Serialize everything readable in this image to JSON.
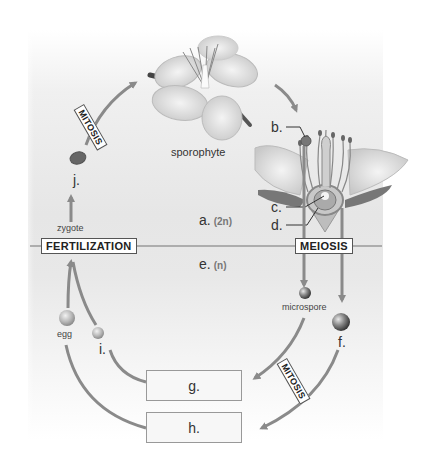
{
  "diagram": {
    "regions": {
      "diploid": {
        "letter": "a.",
        "ploidy": "(2n)"
      },
      "haploid": {
        "letter": "e.",
        "ploidy": "(n)"
      }
    },
    "processes": {
      "mitosis_top": "MITOSIS",
      "fertilization": "FERTILIZATION",
      "meiosis": "MEIOSIS",
      "mitosis_bottom": "MITOSIS"
    },
    "labels": {
      "sporophyte": "sporophyte",
      "zygote": "zygote",
      "microspore": "microspore",
      "egg": "egg"
    },
    "letters": {
      "b": "b.",
      "c": "c.",
      "d": "d.",
      "f": "f.",
      "i": "i.",
      "j": "j."
    },
    "answer_boxes": {
      "g": "g.",
      "h": "h."
    },
    "colors": {
      "arrow": "#8a8a8a",
      "divider": "#9a9a9a",
      "box_border": "#555555",
      "panel": "#e6e6e6"
    }
  }
}
